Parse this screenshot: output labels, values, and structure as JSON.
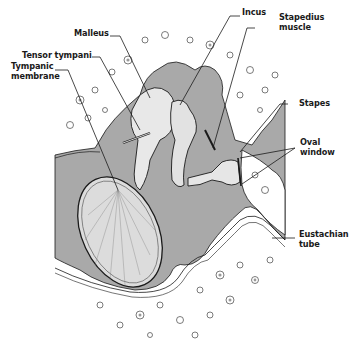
{
  "diagram": {
    "colors": {
      "cavity_gray": "#a9a9a9",
      "bone_white": "#ffffff",
      "line": "#1a1a1a",
      "ossicle_light": "#e6e6e6",
      "ossicle_shade": "#7a7a7a"
    },
    "labels": [
      {
        "id": "malleus",
        "lines": [
          "Malleus"
        ]
      },
      {
        "id": "incus",
        "lines": [
          "Incus"
        ]
      },
      {
        "id": "stapedius",
        "lines": [
          "Stapedius",
          "muscle"
        ]
      },
      {
        "id": "tensor",
        "lines": [
          "Tensor tympani"
        ]
      },
      {
        "id": "tympanic",
        "lines": [
          "Tympanic",
          "membrane"
        ]
      },
      {
        "id": "stapes",
        "lines": [
          "Stapes"
        ]
      },
      {
        "id": "oval",
        "lines": [
          "Oval",
          "window"
        ]
      },
      {
        "id": "eustachian",
        "lines": [
          "Eustachian",
          "tube"
        ]
      }
    ]
  }
}
